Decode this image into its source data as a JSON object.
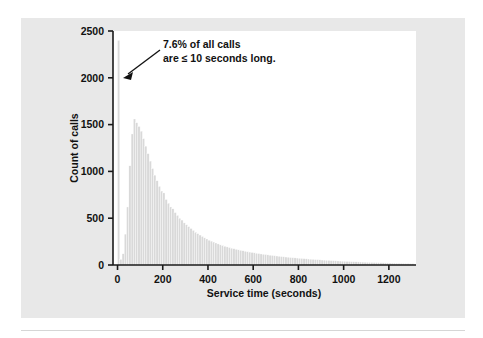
{
  "figure": {
    "background_color": "#e8e8e8",
    "plot_background_color": "#ffffff",
    "bar_color": "#d9d9d9",
    "bar_edge_color": "#ffffff",
    "axis_color": "#1a1a1a",
    "text_color": "#111111"
  },
  "annotation": {
    "line1": "7.6% of all calls",
    "line2": "are ≤ 10 seconds long."
  },
  "chart_data": {
    "type": "bar",
    "title": "",
    "subtitle": "",
    "xlabel": "Service time (seconds)",
    "ylabel": "Count of calls",
    "xlim": [
      -20,
      1320
    ],
    "ylim": [
      0,
      2500
    ],
    "xticks": [
      0,
      200,
      400,
      600,
      800,
      1000,
      1200
    ],
    "xticklabels": [
      "0",
      "200",
      "400",
      "600",
      "800",
      "1000",
      "1200"
    ],
    "yticks": [
      0,
      500,
      1000,
      1500,
      2000,
      2500
    ],
    "yticklabels": [
      "0",
      "500",
      "1000",
      "1500",
      "2000",
      "2500"
    ],
    "grid": false,
    "legend": false,
    "bin_width": 10,
    "bin_starts": [
      0,
      10,
      20,
      30,
      40,
      50,
      60,
      70,
      80,
      90,
      100,
      110,
      120,
      130,
      140,
      150,
      160,
      170,
      180,
      190,
      200,
      210,
      220,
      230,
      240,
      250,
      260,
      270,
      280,
      290,
      300,
      310,
      320,
      330,
      340,
      350,
      360,
      370,
      380,
      390,
      400,
      410,
      420,
      430,
      440,
      450,
      460,
      470,
      480,
      490,
      500,
      510,
      520,
      530,
      540,
      550,
      560,
      570,
      580,
      590,
      600,
      610,
      620,
      630,
      640,
      650,
      660,
      670,
      680,
      690,
      700,
      710,
      720,
      730,
      740,
      750,
      760,
      770,
      780,
      790,
      800,
      810,
      820,
      830,
      840,
      850,
      860,
      870,
      880,
      890,
      900,
      910,
      920,
      930,
      940,
      950,
      960,
      970,
      980,
      990,
      1000,
      1010,
      1020,
      1030,
      1040,
      1050,
      1060,
      1070,
      1080,
      1090,
      1100,
      1110,
      1120,
      1130,
      1140,
      1150,
      1160,
      1170,
      1180,
      1190,
      1200,
      1210,
      1220,
      1230,
      1240,
      1250,
      1260,
      1270,
      1280,
      1290,
      1300
    ],
    "values": [
      2400,
      60,
      120,
      330,
      620,
      1060,
      1400,
      1560,
      1520,
      1480,
      1430,
      1350,
      1270,
      1190,
      1110,
      1030,
      960,
      900,
      840,
      790,
      770,
      700,
      660,
      620,
      600,
      560,
      530,
      500,
      480,
      450,
      430,
      410,
      390,
      370,
      350,
      335,
      320,
      305,
      290,
      278,
      265,
      255,
      245,
      235,
      225,
      215,
      208,
      200,
      193,
      186,
      180,
      174,
      168,
      162,
      157,
      152,
      147,
      142,
      138,
      134,
      130,
      126,
      122,
      118,
      115,
      112,
      108,
      105,
      102,
      99,
      96,
      93,
      90,
      88,
      85,
      83,
      80,
      78,
      76,
      74,
      72,
      70,
      68,
      66,
      64,
      62,
      60,
      58,
      57,
      55,
      53,
      52,
      50,
      49,
      47,
      46,
      45,
      43,
      42,
      41,
      40,
      38,
      37,
      36,
      35,
      34,
      33,
      32,
      31,
      30,
      29,
      28,
      27,
      26,
      26,
      25,
      24,
      23,
      22,
      22,
      21,
      20,
      20,
      19,
      18,
      18,
      17,
      16,
      16,
      15,
      15
    ],
    "peak_spike_value": 2400,
    "secondary_peak_value": 1560,
    "secondary_peak_x": 70
  }
}
